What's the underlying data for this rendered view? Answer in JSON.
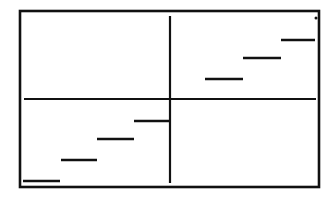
{
  "chart_data": {
    "type": "line",
    "subtype": "step-function",
    "title": "",
    "xlabel": "",
    "ylabel": "",
    "grid": false,
    "legend": null,
    "axes": "cross through origin, no ticks or labels",
    "note": "Staircase graph of a step function (greatest-integer style); 4 steps in quadrant III, 3 steps in quadrant I, isolated dot at top-right corner",
    "segments": [
      {
        "x": [
          -4,
          -3
        ],
        "y": -4
      },
      {
        "x": [
          -3,
          -2
        ],
        "y": -3
      },
      {
        "x": [
          -2,
          -1
        ],
        "y": -2
      },
      {
        "x": [
          -1,
          0
        ],
        "y": -1
      },
      {
        "x": [
          1,
          2
        ],
        "y": 1
      },
      {
        "x": [
          2,
          3
        ],
        "y": 2
      },
      {
        "x": [
          3,
          4
        ],
        "y": 3
      }
    ],
    "points": [
      {
        "x": 4,
        "y": 4.5
      }
    ],
    "colors": {
      "line": "#111111",
      "frame": "#111111",
      "background": "#ffffff"
    }
  },
  "layout": {
    "frame": {
      "x1": 20,
      "y1": 11,
      "x2": 319,
      "y2": 187
    },
    "x_axis": {
      "y": 99,
      "x1": 24,
      "x2": 316
    },
    "y_axis": {
      "x": 170,
      "y1": 16,
      "y2": 183
    },
    "segments_px": [
      {
        "x1": 23,
        "x2": 60,
        "y": 181
      },
      {
        "x1": 61,
        "x2": 97,
        "y": 160
      },
      {
        "x1": 97,
        "x2": 134,
        "y": 139
      },
      {
        "x1": 134,
        "x2": 169,
        "y": 121
      },
      {
        "x1": 205,
        "x2": 243,
        "y": 79
      },
      {
        "x1": 243,
        "x2": 281,
        "y": 58
      },
      {
        "x1": 281,
        "x2": 315,
        "y": 40
      }
    ],
    "dot_px": {
      "x": 316,
      "y": 18,
      "r": 1.5
    }
  }
}
